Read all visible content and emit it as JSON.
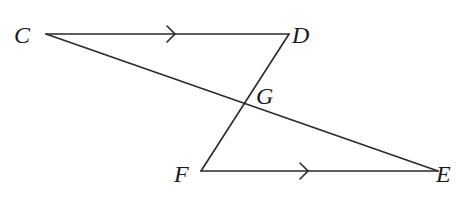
{
  "diagram": {
    "type": "geometry",
    "points": {
      "C": {
        "label": "C",
        "x": 46,
        "y": 34,
        "lx": 14,
        "ly": 43
      },
      "D": {
        "label": "D",
        "x": 289,
        "y": 34,
        "lx": 292,
        "ly": 43
      },
      "F": {
        "label": "F",
        "x": 201,
        "y": 171,
        "lx": 174,
        "ly": 182
      },
      "E": {
        "label": "E",
        "x": 438,
        "y": 171,
        "lx": 436,
        "ly": 182
      },
      "G": {
        "label": "G",
        "x": 244,
        "y": 103,
        "lx": 256,
        "ly": 104
      }
    },
    "segments": [
      "CD",
      "DF",
      "FE",
      "CE"
    ],
    "parallel_marks": [
      {
        "segment": "CD",
        "x": 172,
        "y": 34
      },
      {
        "segment": "FE",
        "x": 305,
        "y": 171
      }
    ],
    "colors": {
      "line": "#2a2a2a",
      "text": "#1a1a1a",
      "background": "#ffffff"
    }
  }
}
